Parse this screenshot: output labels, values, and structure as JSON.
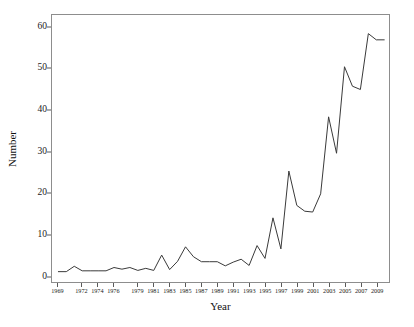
{
  "chart_data": {
    "type": "line",
    "title": "",
    "xlabel": "Year",
    "ylabel": "Number",
    "xlim": [
      1968.2,
      2010.6
    ],
    "ylim": [
      -1.5,
      63.0
    ],
    "grid": false,
    "legend": null,
    "y_ticks": [
      0,
      10,
      20,
      30,
      40,
      50,
      60
    ],
    "y_tick_labels": [
      "0",
      "10",
      "20",
      "30",
      "40",
      "50",
      "60"
    ],
    "x_ticks": [
      1969,
      1972,
      1974,
      1976,
      1979,
      1981,
      1983,
      1985,
      1987,
      1989,
      1991,
      1993,
      1995,
      1997,
      1999,
      2001,
      2003,
      2005,
      2007,
      2009
    ],
    "x_tick_labels": [
      "1969",
      "1972",
      "1974",
      "1976",
      "1979",
      "1981",
      "1983",
      "1985",
      "1987",
      "1989",
      "1991",
      "1993",
      "1995",
      "1997",
      "1999",
      "2001",
      "2003",
      "2005",
      "2007",
      "2009"
    ],
    "line_color": "#3a3a3a",
    "line_width": 1,
    "markers": false,
    "x": [
      1969,
      1970,
      1971,
      1972,
      1973,
      1974,
      1975,
      1976,
      1977,
      1978,
      1979,
      1980,
      1981,
      1982,
      1983,
      1984,
      1985,
      1986,
      1987,
      1988,
      1989,
      1990,
      1991,
      1992,
      1993,
      1994,
      1995,
      1996,
      1997,
      1998,
      1999,
      2000,
      2001,
      2002,
      2003,
      2004,
      2005,
      2006,
      2007,
      2008,
      2009,
      2010
    ],
    "y": [
      1.0,
      1.0,
      2.3,
      1.2,
      1.2,
      1.2,
      1.2,
      2.0,
      1.6,
      2.0,
      1.3,
      1.8,
      1.3,
      5.0,
      1.5,
      3.5,
      7.0,
      4.6,
      3.4,
      3.4,
      3.4,
      2.4,
      3.3,
      4.0,
      2.5,
      7.3,
      4.2,
      14.0,
      6.5,
      25.3,
      17.0,
      15.6,
      15.4,
      19.8,
      38.4,
      29.6,
      50.5,
      45.8,
      45.0,
      58.5,
      57.0,
      57.0
    ],
    "series": [
      {
        "name": "Number",
        "values": [
          1.0,
          1.0,
          2.3,
          1.2,
          1.2,
          1.2,
          1.2,
          2.0,
          1.6,
          2.0,
          1.3,
          1.8,
          1.3,
          5.0,
          1.5,
          3.5,
          7.0,
          4.6,
          3.4,
          3.4,
          3.4,
          2.4,
          3.3,
          4.0,
          2.5,
          7.3,
          4.2,
          14.0,
          6.5,
          25.3,
          17.0,
          15.6,
          15.4,
          19.8,
          38.4,
          29.6,
          50.5,
          45.8,
          45.0,
          58.5,
          57.0,
          57.0
        ]
      }
    ]
  }
}
